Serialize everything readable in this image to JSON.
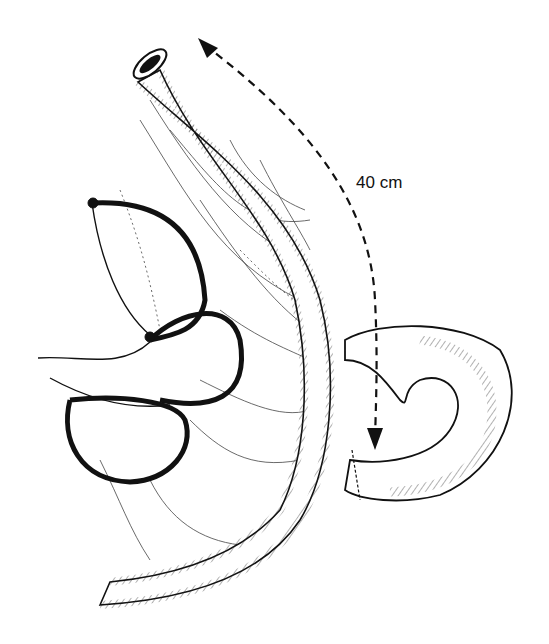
{
  "figure": {
    "type": "surgical line illustration",
    "background": "#ffffff",
    "ink_color": "#111111",
    "annotations": [
      {
        "id": "length-label",
        "text": "40 cm",
        "x": 356,
        "y": 173
      }
    ],
    "arrows": [
      {
        "id": "measure-arrow",
        "style": "dashed",
        "direction": "bidirectional",
        "from": [
          200,
          42
        ],
        "to": [
          375,
          448
        ]
      }
    ],
    "structures": [
      {
        "id": "roux-limb",
        "description": "long bowel limb with open lumen at top"
      },
      {
        "id": "pouches",
        "description": "three loops joined by sutures on left"
      },
      {
        "id": "mesentery",
        "description": "fan of vessels between limb and loops"
      },
      {
        "id": "anastomosis-loop",
        "description": "coiled bowel on right joined with sutures"
      }
    ]
  }
}
